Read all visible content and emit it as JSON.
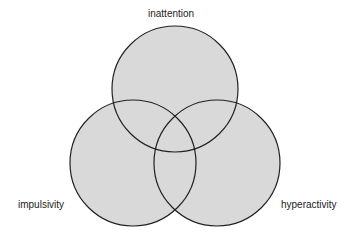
{
  "diagram": {
    "type": "venn",
    "fill_color": "#d9d9d9",
    "stroke_color": "#222222",
    "sets": [
      {
        "label": "inattention",
        "cx": 175,
        "cy": 89,
        "r": 63
      },
      {
        "label": "impulsivity",
        "cx": 133,
        "cy": 163,
        "r": 63
      },
      {
        "label": "hyperactivity",
        "cx": 217,
        "cy": 163,
        "r": 63
      }
    ]
  }
}
